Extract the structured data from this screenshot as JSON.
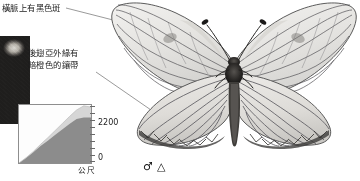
{
  "figure": {
    "type": "butterfly-specimen-plate",
    "background": "#ffffff"
  },
  "annotations": [
    {
      "id": "vein-spot",
      "text": "橫脈上有黑色斑",
      "meaning_en": "black spot on the discal cross-vein"
    },
    {
      "id": "orange-band",
      "line1": "後翅亞外緣有",
      "line2": "暗橙色的鑲帶",
      "meaning_en": "dark orange band on hindwing submargin"
    }
  ],
  "chart_data": {
    "type": "area",
    "title": "",
    "xlabel": "",
    "ylabel": "公尺",
    "unit_label": "公尺",
    "ylim": [
      0,
      2800
    ],
    "yticks": [
      0,
      2200
    ],
    "ytick_labels": [
      "0",
      "2200"
    ],
    "grid": false,
    "legend": "none",
    "x": [
      0,
      10,
      20,
      30,
      40,
      50,
      60,
      70,
      80,
      90,
      100
    ],
    "series": [
      {
        "name": "分布高度",
        "values": [
          0,
          240,
          520,
          820,
          1080,
          1350,
          1620,
          1880,
          2120,
          2200,
          2200
        ],
        "fill": "#8c8c8c"
      },
      {
        "name": "分布高度上限",
        "values": [
          0,
          260,
          560,
          900,
          1220,
          1560,
          1900,
          2240,
          2560,
          2760,
          2700
        ],
        "fill": "#d6d6d6"
      }
    ]
  },
  "symbols": {
    "sex": "♂",
    "shape": "△",
    "combined": "♂ △"
  },
  "photo_strip": {
    "caption": "",
    "description": "dark habitat photograph crop"
  },
  "colors": {
    "ink": "#1c1c1c",
    "leader_line": "#6f6f6f",
    "chart_border": "#8e8e8e",
    "chart_fill_dark": "#8c8c8c",
    "chart_fill_light": "#d6d6d6",
    "wing_pale": "#e9e8e5",
    "vein_dark": "#3a3a3a"
  }
}
